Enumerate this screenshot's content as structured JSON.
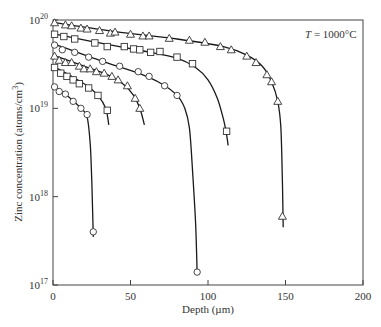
{
  "chart_data": {
    "type": "line",
    "title": "",
    "annotation": "T = 1000°C",
    "annotation_parts": {
      "var": "T",
      "rest": " = 1000°C"
    },
    "xlabel": "Depth (µm)",
    "ylabel": "Zinc concentration (atoms/cm³)",
    "ylabel_parts": {
      "main": "Zinc concentration (atoms/cm",
      "sup": "3",
      "end": ")"
    },
    "xlim": [
      0,
      200
    ],
    "ylim": [
      1e+17,
      1e+20
    ],
    "yscale": "log",
    "x_ticks": [
      0,
      50,
      100,
      150,
      200
    ],
    "x_tick_labels": [
      "0",
      "50",
      "100",
      "150",
      "200"
    ],
    "y_ticks": [
      17,
      18,
      19,
      20
    ],
    "y_tick_labels": [
      {
        "base": "10",
        "exp": "17"
      },
      {
        "base": "10",
        "exp": "18"
      },
      {
        "base": "10",
        "exp": "19"
      },
      {
        "base": "10",
        "exp": "20"
      }
    ],
    "grid": false,
    "legend": "none",
    "series": [
      {
        "name": "profile-1 (longest diffusion)",
        "marker": "triangle",
        "points": [
          [
            1,
            9.3e+19
          ],
          [
            8,
            8.8e+19
          ],
          [
            12,
            8.6e+19
          ],
          [
            18,
            8.1e+19
          ],
          [
            22,
            7.9e+19
          ],
          [
            30,
            7.6e+19
          ],
          [
            37,
            7.1e+19
          ],
          [
            40,
            7.3e+19
          ],
          [
            50,
            6.9e+19
          ],
          [
            58,
            6.6e+19
          ],
          [
            62,
            6.6e+19
          ],
          [
            75,
            6.2e+19
          ],
          [
            88,
            5.9e+19
          ],
          [
            98,
            5.6e+19
          ],
          [
            108,
            5e+19
          ],
          [
            115,
            4.6e+19
          ],
          [
            125,
            3.9e+19
          ],
          [
            131,
            3.3e+19
          ],
          [
            138,
            2.4e+19
          ],
          [
            141,
            2e+19
          ],
          [
            145,
            1.2e+19
          ],
          [
            148,
            6e+17
          ]
        ],
        "curve": [
          [
            0,
            9.4e+19
          ],
          [
            40,
            7.4e+19
          ],
          [
            80,
            6.1e+19
          ],
          [
            110,
            5e+19
          ],
          [
            125,
            4e+19
          ],
          [
            135,
            3e+19
          ],
          [
            141,
            2e+19
          ],
          [
            145,
            1.2e+19
          ],
          [
            147,
            6e+18
          ],
          [
            148,
            1.5e+18
          ],
          [
            148.5,
            4.5e+17
          ]
        ]
      },
      {
        "name": "profile-2",
        "marker": "square",
        "points": [
          [
            1,
            6.9e+19
          ],
          [
            7,
            6.5e+19
          ],
          [
            14,
            6.1e+19
          ],
          [
            27,
            5.5e+19
          ],
          [
            35,
            5e+19
          ],
          [
            46,
            5e+19
          ],
          [
            52,
            4.7e+19
          ],
          [
            56,
            4.6e+19
          ],
          [
            63,
            4.3e+19
          ],
          [
            69,
            4.4e+19
          ],
          [
            80,
            3.8e+19
          ],
          [
            90,
            3.2e+19
          ],
          [
            112,
            5.5e+18
          ]
        ],
        "curve": [
          [
            0,
            7e+19
          ],
          [
            30,
            5.5e+19
          ],
          [
            60,
            4.4e+19
          ],
          [
            80,
            3.7e+19
          ],
          [
            92,
            2.9e+19
          ],
          [
            100,
            2.1e+19
          ],
          [
            106,
            1.3e+19
          ],
          [
            110,
            7.5e+18
          ],
          [
            112,
            5e+18
          ],
          [
            113,
            3.8e+18
          ]
        ]
      },
      {
        "name": "profile-3",
        "marker": "circle",
        "points": [
          [
            1,
            5.2e+19
          ],
          [
            6,
            4.6e+19
          ],
          [
            14,
            4.3e+19
          ],
          [
            23,
            3.8e+19
          ],
          [
            32,
            3.4e+19
          ],
          [
            43,
            3e+19
          ],
          [
            55,
            2.6e+19
          ],
          [
            62,
            2.3e+19
          ],
          [
            72,
            1.8e+19
          ],
          [
            80,
            1.4e+19
          ],
          [
            93,
            1.4e+17
          ]
        ],
        "curve": [
          [
            0,
            5.4e+19
          ],
          [
            30,
            3.5e+19
          ],
          [
            55,
            2.5e+19
          ],
          [
            70,
            1.9e+19
          ],
          [
            80,
            1.4e+19
          ],
          [
            85,
            1e+19
          ],
          [
            88,
            6e+18
          ],
          [
            90,
            2e+18
          ],
          [
            92,
            5e+17
          ],
          [
            93,
            1.3e+17
          ]
        ]
      },
      {
        "name": "profile-4",
        "marker": "triangle",
        "points": [
          [
            1,
            3.9e+19
          ],
          [
            4,
            3.5e+19
          ],
          [
            8,
            3.3e+19
          ],
          [
            12,
            3.3e+19
          ],
          [
            17,
            3e+19
          ],
          [
            20,
            2.8e+19
          ],
          [
            24,
            2.8e+19
          ],
          [
            28,
            2.6e+19
          ],
          [
            33,
            2.5e+19
          ],
          [
            38,
            2.3e+19
          ],
          [
            42,
            2.1e+19
          ],
          [
            48,
            1.8e+19
          ],
          [
            53,
            1.3e+19
          ],
          [
            56,
            1e+19
          ]
        ],
        "curve": [
          [
            0,
            4e+19
          ],
          [
            20,
            3e+19
          ],
          [
            35,
            2.4e+19
          ],
          [
            45,
            1.9e+19
          ],
          [
            52,
            1.4e+19
          ],
          [
            56,
            1e+19
          ],
          [
            59,
            6.5e+18
          ]
        ]
      },
      {
        "name": "profile-5",
        "marker": "square",
        "points": [
          [
            1,
            2.9e+19
          ],
          [
            5,
            2.5e+19
          ],
          [
            9,
            2.3e+19
          ],
          [
            13,
            2.1e+19
          ],
          [
            17,
            1.9e+19
          ],
          [
            23,
            1.7e+19
          ],
          [
            29,
            1.4e+19
          ],
          [
            35,
            9.5e+18
          ]
        ],
        "curve": [
          [
            0,
            3e+19
          ],
          [
            12,
            2.3e+19
          ],
          [
            22,
            1.8e+19
          ],
          [
            29,
            1.4e+19
          ],
          [
            34,
            1e+19
          ],
          [
            36,
            6.5e+18
          ]
        ]
      },
      {
        "name": "profile-6 (shortest diffusion)",
        "marker": "circle",
        "points": [
          [
            1,
            1.75e+19
          ],
          [
            4,
            1.55e+19
          ],
          [
            8,
            1.45e+19
          ],
          [
            13,
            1.2e+19
          ],
          [
            18,
            1e+19
          ],
          [
            22,
            8.5e+18
          ],
          [
            26,
            4e+17
          ]
        ],
        "curve": [
          [
            0,
            1.8e+19
          ],
          [
            10,
            1.35e+19
          ],
          [
            18,
            1e+19
          ],
          [
            22,
            8e+18
          ],
          [
            24,
            4e+18
          ],
          [
            25,
            1.5e+18
          ],
          [
            26,
            3.5e+17
          ]
        ]
      }
    ]
  },
  "colors": {
    "axis": "#444444",
    "line": "#1a1a1a",
    "marker_fill": "#ffffff",
    "marker_stroke": "#333333",
    "text": "#333333",
    "background": "#ffffff"
  }
}
